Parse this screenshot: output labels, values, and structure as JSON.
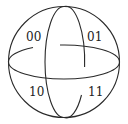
{
  "diagram": {
    "type": "sphere-quadrant-labels",
    "labels": {
      "top_left": "00",
      "top_right": "01",
      "bottom_left": "10",
      "bottom_right": "11"
    },
    "stroke_color": "#2a2a2a",
    "background": "#ffffff"
  }
}
